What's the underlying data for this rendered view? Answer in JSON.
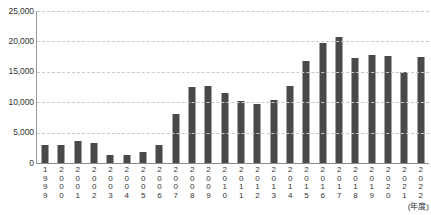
{
  "chart_data": {
    "type": "bar",
    "title": "",
    "subtitle": "",
    "xlabel": "(年度)",
    "ylabel": "",
    "ylim": [
      0,
      25000
    ],
    "ytick_labels": [
      "25,000",
      "20,000",
      "15,000",
      "10,000",
      "5,000",
      "0"
    ],
    "ytick_values": [
      25000,
      20000,
      15000,
      10000,
      5000,
      0
    ],
    "grid": true,
    "legend": null,
    "legend_position": "none",
    "bar_color": "#494949",
    "gridline_color": "#c9c9c9",
    "axis_color": "#8a8a8a",
    "categories": [
      "1999",
      "2000",
      "2001",
      "2002",
      "2003",
      "2004",
      "2005",
      "2006",
      "2007",
      "2008",
      "2009",
      "2010",
      "2011",
      "2012",
      "2013",
      "2014",
      "2015",
      "2016",
      "2017",
      "2018",
      "2019",
      "2020",
      "2021",
      "2022"
    ],
    "values": [
      2900,
      2900,
      3700,
      3300,
      1400,
      1300,
      1800,
      2900,
      8000,
      12500,
      12600,
      11500,
      10200,
      9700,
      10300,
      12700,
      16700,
      19800,
      20700,
      17200,
      17700,
      17600,
      15000,
      17500
    ]
  },
  "axis": {
    "unit_label": "(年度)"
  }
}
